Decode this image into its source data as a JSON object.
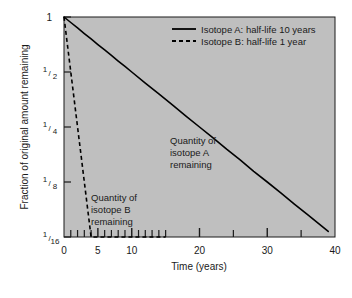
{
  "chart_data": {
    "type": "line",
    "title": "",
    "xlabel": "Time (years)",
    "ylabel": "Fraction of original amount remaining",
    "xlim": [
      0,
      40
    ],
    "ylim_fraction": [
      0.0625,
      1
    ],
    "yscale": "log2",
    "grid": false,
    "legend_position": "top-right-inside",
    "xticks": [
      0,
      5,
      10,
      20,
      30,
      40
    ],
    "xtick_labels": [
      "0",
      "5",
      "10",
      "20",
      "30",
      "40"
    ],
    "x_minor_ticks": [
      1,
      2,
      3,
      4,
      6,
      7,
      8,
      9,
      11,
      12,
      13,
      14,
      15,
      25,
      35
    ],
    "yticks": [
      1,
      0.5,
      0.25,
      0.125,
      0.0625
    ],
    "ytick_labels": [
      "1",
      "1/2",
      "1/4",
      "1/8",
      "1/16"
    ],
    "ytick_numerators": [
      "1",
      "1",
      "1",
      "1",
      "1"
    ],
    "ytick_denominators": [
      "",
      "2",
      "4",
      "8",
      "16"
    ],
    "series": [
      {
        "name": "Isotope A: half-life 10 years",
        "half_life_years": 10,
        "style": "solid",
        "color": "#000000",
        "x": [
          0,
          1,
          2,
          3,
          4,
          5,
          6,
          7,
          8,
          9,
          10,
          12,
          14,
          16,
          18,
          20,
          22,
          24,
          26,
          28,
          30,
          32,
          34,
          36,
          38,
          39
        ],
        "y": [
          1.0,
          0.933,
          0.871,
          0.812,
          0.758,
          0.707,
          0.66,
          0.616,
          0.574,
          0.536,
          0.5,
          0.435,
          0.379,
          0.33,
          0.287,
          0.25,
          0.218,
          0.189,
          0.165,
          0.143,
          0.125,
          0.109,
          0.0947,
          0.0825,
          0.0718,
          0.067
        ]
      },
      {
        "name": "Isotope B: half-life 1 year",
        "half_life_years": 1,
        "style": "dashed",
        "color": "#000000",
        "x": [
          0,
          0.5,
          1,
          1.5,
          2,
          2.5,
          3,
          3.5,
          4,
          4.5,
          5,
          8,
          11,
          15
        ],
        "y": [
          1.0,
          0.707,
          0.5,
          0.354,
          0.25,
          0.177,
          0.125,
          0.0884,
          0.0625,
          0.0625,
          0.0625,
          0.0625,
          0.0625,
          0.0625
        ]
      }
    ],
    "annotations": [
      {
        "name": "isotope-a-annotation",
        "lines": [
          "Quantity of",
          "isotope A",
          "remaining"
        ],
        "x_years": 19,
        "y_fraction": 0.33
      },
      {
        "name": "isotope-b-annotation",
        "lines": [
          "Quantity of",
          "isotope B",
          "remaining"
        ],
        "x_years": 6,
        "y_fraction": 0.135
      }
    ],
    "legend": [
      {
        "label": "Isotope A: half-life 10 years",
        "style": "solid"
      },
      {
        "label": "Isotope B: half-life 1 year",
        "style": "dashed"
      }
    ],
    "colors": {
      "plot_background": "#bfbfbf",
      "page_background": "#ffffff",
      "axis": "#1a1a1a",
      "text": "#1a1a1a",
      "curve": "#000000"
    }
  },
  "axes": {
    "x_title": "Time (years)",
    "y_title": "Fraction of original amount remaining"
  },
  "legend": {
    "entry_a": "Isotope A: half-life 10 years",
    "entry_b": "Isotope B: half-life 1 year"
  },
  "annotations": {
    "a_line1": "Quantity of",
    "a_line2": "isotope A",
    "a_line3": "remaining",
    "b_line1": "Quantity of",
    "b_line2": "isotope B",
    "b_line3": "remaining"
  },
  "xticks": {
    "t0": "0",
    "t5": "5",
    "t10": "10",
    "t20": "20",
    "t30": "30",
    "t40": "40"
  },
  "yticks": {
    "y1": "1",
    "y2_num": "1",
    "y2_den": "2",
    "y4_num": "1",
    "y4_den": "4",
    "y8_num": "1",
    "y8_den": "8",
    "y16_num": "1",
    "y16_den": "16"
  }
}
